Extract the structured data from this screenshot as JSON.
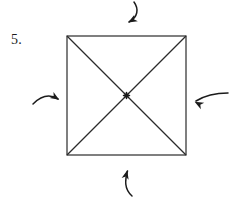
{
  "figure": {
    "item_label": "5.",
    "canvas": {
      "width": 243,
      "height": 203,
      "background": "#ffffff"
    },
    "stroke_color": "#2b2b2b",
    "ink_color": "#1b1b1b",
    "shape": {
      "name": "square",
      "left": 67,
      "top": 36,
      "right": 186,
      "bottom": 155,
      "width": 119,
      "height": 119,
      "stroke_width": 1.2,
      "fill": "none"
    },
    "diagonals": [
      {
        "name": "diagonal-top-left-to-bottom-right",
        "x1": 67,
        "y1": 36,
        "x2": 186,
        "y2": 155
      },
      {
        "name": "diagonal-top-right-to-bottom-left",
        "x1": 186,
        "y1": 36,
        "x2": 67,
        "y2": 155
      }
    ],
    "center_point": {
      "name": "center-mark",
      "x": 126.5,
      "y": 95.5,
      "style": "asterisk",
      "radius": 2.1,
      "tick_length": 6
    },
    "arrows": [
      {
        "name": "arrow-top",
        "direction": "down-left",
        "path": "M 134 2 C 139 9 138 17 129 22",
        "head_x": 128.2,
        "head_y": 22.6,
        "head_angle": 150
      },
      {
        "name": "arrow-bottom",
        "direction": "up",
        "path": "M 132 196 C 124 189 125 180 127.5 171",
        "head_x": 127.3,
        "head_y": 170.2,
        "head_angle": -76
      },
      {
        "name": "arrow-left",
        "direction": "right",
        "path": "M 33 104 C 41 96 50 94 58 99",
        "head_x": 59.2,
        "head_y": 99.8,
        "head_angle": 32
      },
      {
        "name": "arrow-right",
        "direction": "left",
        "path": "M 228 93 C 216 93 204 96 196 101",
        "head_x": 194.6,
        "head_y": 101.8,
        "head_angle": 208
      }
    ]
  }
}
